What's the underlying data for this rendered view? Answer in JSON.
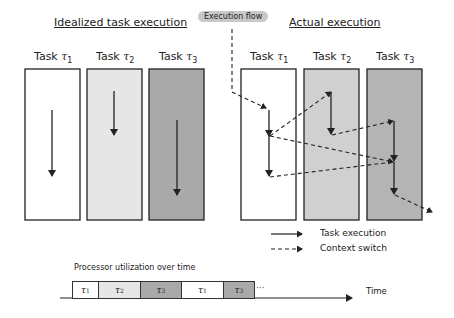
{
  "left_panel": {
    "title": "Idealized task execution",
    "tasks": [
      {
        "label": "Task",
        "symbol": "τ",
        "index": "1",
        "fill": "#ffffff"
      },
      {
        "label": "Task",
        "symbol": "τ",
        "index": "2",
        "fill": "#e6e6e6"
      },
      {
        "label": "Task",
        "symbol": "τ",
        "index": "3",
        "fill": "#a9a9a9"
      }
    ]
  },
  "right_panel": {
    "title": "Actual execution",
    "flow_label": "Execution flow",
    "tasks": [
      {
        "label": "Task",
        "symbol": "τ",
        "index": "1",
        "fill": "#ffffff"
      },
      {
        "label": "Task",
        "symbol": "τ",
        "index": "2",
        "fill": "#d0d0d0"
      },
      {
        "label": "Task",
        "symbol": "τ",
        "index": "3",
        "fill": "#b4b4b4"
      }
    ]
  },
  "legend": {
    "solid": "Task execution",
    "dashed": "Context switch"
  },
  "timeline": {
    "title": "Processor utilization over time",
    "axis_label": "Time",
    "ellipsis": "···",
    "segments": [
      {
        "symbol": "τ",
        "index": "1",
        "fill": "#ffffff"
      },
      {
        "symbol": "τ",
        "index": "2",
        "fill": "#e6e6e6"
      },
      {
        "symbol": "τ",
        "index": "3",
        "fill": "#a9a9a9"
      },
      {
        "symbol": "τ",
        "index": "1",
        "fill": "#ffffff"
      },
      {
        "symbol": "τ",
        "index": "3",
        "fill": "#a9a9a9"
      }
    ]
  }
}
